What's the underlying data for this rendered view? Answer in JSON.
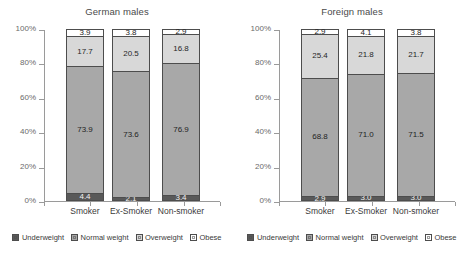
{
  "chart_data": [
    {
      "type": "bar",
      "title": "German males",
      "xlabel": "",
      "ylabel": "",
      "ylim": [
        0,
        100
      ],
      "stacked": true,
      "grid": false,
      "legend_position": "bottom",
      "ytick_labels": [
        "0%",
        "20%",
        "40%",
        "60%",
        "80%",
        "100%"
      ],
      "ytick_values": [
        0,
        20,
        40,
        60,
        80,
        100
      ],
      "categories": [
        "Smoker",
        "Ex-Smoker",
        "Non-smoker"
      ],
      "series": [
        {
          "name": "Underweight",
          "values": [
            4.4,
            2.1,
            3.4
          ]
        },
        {
          "name": "Normal weight",
          "values": [
            73.9,
            73.6,
            76.9
          ]
        },
        {
          "name": "Overweight",
          "values": [
            17.7,
            20.5,
            16.8
          ]
        },
        {
          "name": "Obese",
          "values": [
            3.9,
            3.8,
            2.9
          ]
        }
      ]
    },
    {
      "type": "bar",
      "title": "Foreign males",
      "xlabel": "",
      "ylabel": "",
      "ylim": [
        0,
        100
      ],
      "stacked": true,
      "grid": false,
      "legend_position": "bottom",
      "ytick_labels": [
        "0%",
        "20%",
        "40%",
        "60%",
        "80%",
        "100%"
      ],
      "ytick_values": [
        0,
        20,
        40,
        60,
        80,
        100
      ],
      "categories": [
        "Smoker",
        "Ex-Smoker",
        "Non-smoker"
      ],
      "series": [
        {
          "name": "Underweight",
          "values": [
            2.9,
            3.0,
            3.0
          ]
        },
        {
          "name": "Normal weight",
          "values": [
            68.8,
            71.0,
            71.5
          ]
        },
        {
          "name": "Overweight",
          "values": [
            25.4,
            21.8,
            21.7
          ]
        },
        {
          "name": "Obese",
          "values": [
            2.9,
            4.1,
            3.8
          ]
        }
      ]
    }
  ],
  "colors": {
    "underweight": "#595959",
    "normal_weight": "#a8a8a8",
    "overweight": "#d8d8d8",
    "obese": "#ffffff",
    "outline": "#4d4d4d",
    "axis": "#9a9a9a",
    "text": "#3a3a3a"
  }
}
